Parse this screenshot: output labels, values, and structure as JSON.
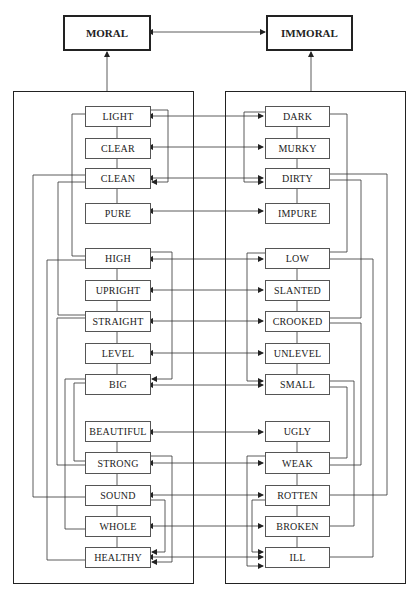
{
  "top": {
    "moral": "MORAL",
    "immoral": "IMMORAL"
  },
  "left_terms": [
    "LIGHT",
    "CLEAR",
    "CLEAN",
    "PURE",
    "HIGH",
    "UPRIGHT",
    "STRAIGHT",
    "LEVEL",
    "BIG",
    "BEAUTIFUL",
    "STRONG",
    "SOUND",
    "WHOLE",
    "HEALTHY"
  ],
  "right_terms": [
    "DARK",
    "MURKY",
    "DIRTY",
    "IMPURE",
    "LOW",
    "SLANTED",
    "CROOKED",
    "UNLEVEL",
    "SMALL",
    "UGLY",
    "WEAK",
    "ROTTEN",
    "BROKEN",
    "ILL"
  ],
  "pairs": [
    [
      "LIGHT",
      "DARK"
    ],
    [
      "CLEAR",
      "MURKY"
    ],
    [
      "CLEAN",
      "DIRTY"
    ],
    [
      "PURE",
      "IMPURE"
    ],
    [
      "HIGH",
      "LOW"
    ],
    [
      "UPRIGHT",
      "SLANTED"
    ],
    [
      "STRAIGHT",
      "CROOKED"
    ],
    [
      "LEVEL",
      "UNLEVEL"
    ],
    [
      "BIG",
      "SMALL"
    ],
    [
      "BEAUTIFUL",
      "UGLY"
    ],
    [
      "STRONG",
      "WEAK"
    ],
    [
      "SOUND",
      "ROTTEN"
    ],
    [
      "WHOLE",
      "BROKEN"
    ],
    [
      "HEALTHY",
      "ILL"
    ]
  ],
  "colors": {
    "line": "#333333",
    "box_border": "#555555",
    "background": "#ffffff"
  }
}
